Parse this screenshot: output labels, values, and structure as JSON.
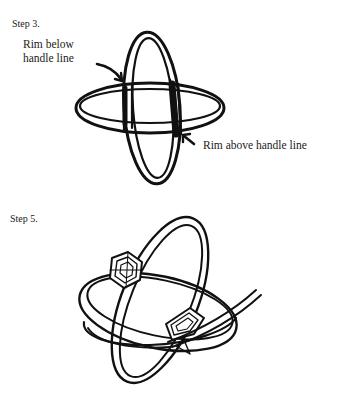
{
  "figures": [
    {
      "id": "step3",
      "title": "Step 3.",
      "callouts": [
        {
          "id": "rim-below",
          "lines": [
            "Rim below",
            "handle line"
          ]
        },
        {
          "id": "rim-above",
          "text": "Rim above handle line"
        }
      ]
    },
    {
      "id": "step5",
      "title": "Step 5."
    }
  ],
  "colors": {
    "ink": "#111111",
    "background": "#ffffff"
  }
}
